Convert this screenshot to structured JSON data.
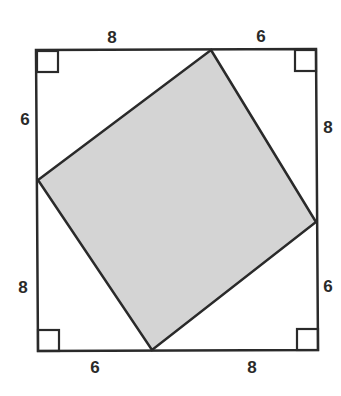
{
  "diagram": {
    "colors": {
      "stroke": "#2a2a2a",
      "inner_fill": "#d4d4d4",
      "background": "#ffffff"
    },
    "outer_square": {
      "top_left": [
        36,
        50
      ],
      "top_right": [
        316,
        49
      ],
      "bottom_right": [
        318,
        350
      ],
      "bottom_left": [
        38,
        351
      ]
    },
    "inner_square": {
      "top": [
        211,
        50
      ],
      "right": [
        316,
        222
      ],
      "bottom": [
        152,
        350
      ],
      "left": [
        38,
        180
      ]
    },
    "labels": {
      "top_left_segment": "8",
      "top_right_segment": "6",
      "left_upper_segment": "6",
      "left_lower_segment": "8",
      "right_upper_segment": "8",
      "right_lower_segment": "6",
      "bottom_left_segment": "6",
      "bottom_right_segment": "8"
    },
    "right_angle_markers": [
      "top-left",
      "top-right",
      "bottom-left",
      "bottom-right"
    ]
  }
}
